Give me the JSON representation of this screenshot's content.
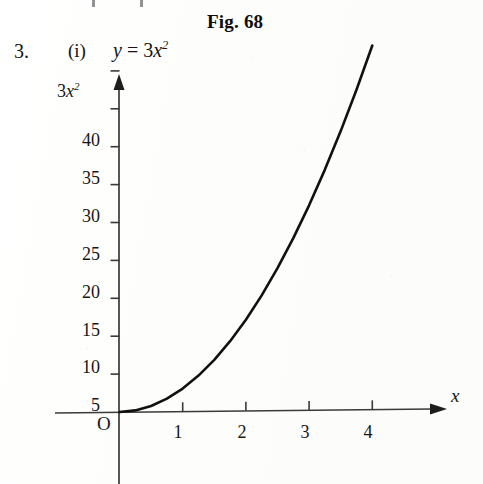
{
  "page": {
    "figure_caption": "Fig. 68",
    "item_number": "3.",
    "item_roman": "(i)",
    "equation_lhs": "y",
    "equation_eq": "=",
    "equation_coefficient": "3",
    "equation_variable": "x",
    "equation_exponent": "2",
    "background_color": "#fdfdfc",
    "ink_color": "#141414"
  },
  "chart_data": {
    "type": "line",
    "title": "Fig. 68",
    "annotation": "3. (i) y = 3x²",
    "function": "y = 3x^2",
    "xlabel": "x",
    "ylabel": "3x²",
    "origin_label": "O",
    "grid": false,
    "legend": null,
    "xlim": [
      -1,
      4.85
    ],
    "ylim": [
      0,
      48
    ],
    "xticks": [
      1,
      2,
      3,
      4
    ],
    "xtick_labels": [
      "1",
      "2",
      "3",
      "4"
    ],
    "yticks": [
      5,
      10,
      15,
      20,
      25,
      30,
      35,
      40,
      45
    ],
    "ytick_labels": [
      "5",
      "10",
      "15",
      "20",
      "25",
      "30",
      "35",
      "40",
      ""
    ],
    "x": [
      0,
      0.25,
      0.5,
      0.75,
      1,
      1.25,
      1.5,
      1.75,
      2,
      2.25,
      2.5,
      2.75,
      3,
      3.25,
      3.5,
      3.75,
      4
    ],
    "y": [
      0,
      0.19,
      0.75,
      1.69,
      3,
      4.69,
      6.75,
      9.19,
      12,
      15.19,
      18.75,
      22.69,
      27,
      31.69,
      36.75,
      42.19,
      48
    ],
    "curve_color": "#111111",
    "curve_width": 2.6,
    "axis_color": "#3a3a3a",
    "x_axis_arrow": true,
    "y_axis_arrow": true
  },
  "ytick_labels_rendered": [
    {
      "label": "40",
      "top": 130
    },
    {
      "label": "35",
      "top": 168
    },
    {
      "label": "30",
      "top": 206
    },
    {
      "label": "25",
      "top": 244
    },
    {
      "label": "20",
      "top": 282
    },
    {
      "label": "15",
      "top": 320
    },
    {
      "label": "10",
      "top": 357
    },
    {
      "label": "5",
      "top": 395
    }
  ],
  "xtick_labels_rendered": [
    {
      "label": "1",
      "left": 165
    },
    {
      "label": "2",
      "left": 229
    },
    {
      "label": "3",
      "left": 292
    },
    {
      "label": "4",
      "left": 355
    }
  ]
}
